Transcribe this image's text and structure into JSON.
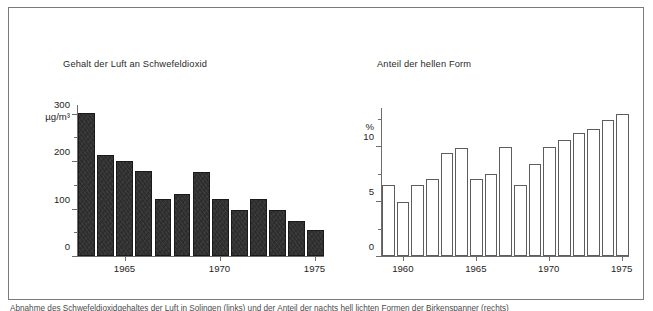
{
  "figure": {
    "caption": "Abnahme des Schwefeldioxidgehaltes der Luft in Solingen (links) und der Anteil der nachts hell lichten Formen der Birkenspanner (rechts)"
  },
  "chart_data": [
    {
      "id": "so2",
      "type": "bar",
      "title": "Gehalt der Luft an Schwefeldioxid",
      "xlabel": "",
      "ylabel": "µg/m³",
      "ylim": [
        0,
        320
      ],
      "ytick_values": [
        0,
        100,
        200,
        300
      ],
      "ytick_labels": [
        "0",
        "100",
        "200",
        "300"
      ],
      "yminor_values": [
        50,
        150,
        250
      ],
      "grid": false,
      "legend": false,
      "bar_style": "filled-dark",
      "categories": [
        "1963",
        "1964",
        "1965",
        "1966",
        "1967",
        "1968",
        "1969",
        "1970",
        "1971",
        "1972",
        "1973",
        "1974",
        "1975"
      ],
      "values": [
        300,
        212,
        200,
        178,
        120,
        131,
        177,
        120,
        97,
        119,
        96,
        74,
        54
      ],
      "xtick_labels": [
        "1965",
        "1970",
        "1975"
      ],
      "xtick_categories": [
        "1965",
        "1970",
        "1975"
      ]
    },
    {
      "id": "morph",
      "type": "bar",
      "title": "Anteil der hellen Form",
      "xlabel": "",
      "ylabel": "%",
      "ylim": [
        0,
        13.6
      ],
      "ytick_values": [
        0,
        5,
        10
      ],
      "ytick_labels": [
        "0",
        "5",
        "10"
      ],
      "yminor_values": [
        2.5,
        7.5,
        12.5
      ],
      "grid": false,
      "legend": false,
      "bar_style": "outlined-light",
      "categories": [
        "1959",
        "1960",
        "1961",
        "1962",
        "1963",
        "1964",
        "1965",
        "1966",
        "1967",
        "1968",
        "1969",
        "1970",
        "1971",
        "1972",
        "1973",
        "1974",
        "1975"
      ],
      "values": [
        6.5,
        4.9,
        6.5,
        7.0,
        9.4,
        9.8,
        7.0,
        7.5,
        9.9,
        6.5,
        8.4,
        9.9,
        10.6,
        11.2,
        11.6,
        12.4,
        12.9
      ],
      "xtick_labels": [
        "1960",
        "1965",
        "1970",
        "1975"
      ],
      "xtick_categories": [
        "1960",
        "1965",
        "1970",
        "1975"
      ]
    }
  ],
  "colors": {
    "frame": "#7b7b7b",
    "axis": "#6d6d6d",
    "bar_dark": "#2d2d2d",
    "bar_light_fill": "#ffffff",
    "bar_light_stroke": "#5d5d5d",
    "text": "#1e1e1e",
    "background": "#ffffff"
  }
}
